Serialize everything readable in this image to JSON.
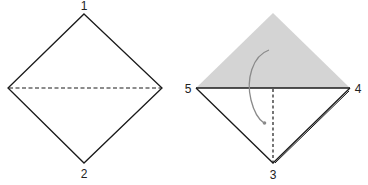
{
  "steps": [
    {
      "name": "step-1",
      "points": {
        "top": "1",
        "bottom": "2"
      },
      "fold_line": "horizontal dashed (valley fold)"
    },
    {
      "name": "step-2",
      "points": {
        "left": "5",
        "right": "4",
        "bottom": "3"
      },
      "fold_line": "vertical dashed (valley fold)",
      "arrow": "curved fold arrow",
      "shaded_region": "top triangle (folded layer)"
    }
  ],
  "colors": {
    "line": "#1a1a1a",
    "shade": "#d4d4d4",
    "arrow": "#8a8a8a"
  }
}
